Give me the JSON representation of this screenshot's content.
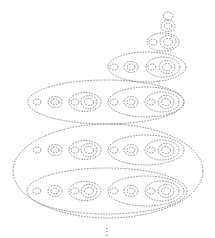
{
  "diagram": {
    "stroke_color": "#6e6e6e",
    "background": "#ffffff",
    "continuation_marker": "⋮",
    "continuation_pos": {
      "x": 107,
      "y": 232
    },
    "levels": [
      {
        "level": 1,
        "shapes": [
          {
            "cx": 168,
            "cy": 16,
            "rx": 5,
            "ry": 4
          }
        ]
      },
      {
        "level": 2,
        "shapes": [
          {
            "cx": 168,
            "cy": 26,
            "rx": 7,
            "ry": 5.5
          },
          {
            "cx": 168,
            "cy": 26,
            "rx": 4,
            "ry": 3
          }
        ]
      },
      {
        "level": 3,
        "shapes": [
          {
            "cx": 163,
            "cy": 42,
            "rx": 16,
            "ry": 9
          },
          {
            "cx": 153,
            "cy": 42,
            "rx": 4,
            "ry": 3
          },
          {
            "cx": 168,
            "cy": 42,
            "rx": 8,
            "ry": 6.5
          },
          {
            "cx": 168,
            "cy": 42,
            "rx": 4.5,
            "ry": 3.5
          }
        ]
      },
      {
        "level": 4,
        "shapes": [
          {
            "cx": 147,
            "cy": 67,
            "rx": 39,
            "ry": 15
          },
          {
            "cx": 114,
            "cy": 67,
            "rx": 4,
            "ry": 3
          },
          {
            "cx": 131,
            "cy": 67,
            "rx": 7,
            "ry": 5.5
          },
          {
            "cx": 131,
            "cy": 67,
            "rx": 4,
            "ry": 3
          },
          {
            "cx": 163,
            "cy": 67,
            "rx": 17,
            "ry": 10
          },
          {
            "cx": 152,
            "cy": 67,
            "rx": 4,
            "ry": 3
          },
          {
            "cx": 167,
            "cy": 67,
            "rx": 8,
            "ry": 6.5
          },
          {
            "cx": 167,
            "cy": 67,
            "rx": 4.5,
            "ry": 3.5
          }
        ]
      },
      {
        "level": 5,
        "shapes": [
          {
            "cx": 106,
            "cy": 102,
            "rx": 78,
            "ry": 22
          },
          {
            "cx": 37,
            "cy": 102,
            "rx": 4,
            "ry": 3
          },
          {
            "cx": 55,
            "cy": 102,
            "rx": 7,
            "ry": 5.5
          },
          {
            "cx": 55,
            "cy": 102,
            "rx": 4,
            "ry": 3
          },
          {
            "cx": 85,
            "cy": 102,
            "rx": 16,
            "ry": 9.5
          },
          {
            "cx": 75,
            "cy": 102,
            "rx": 4,
            "ry": 3
          },
          {
            "cx": 89,
            "cy": 102,
            "rx": 8,
            "ry": 6.5
          },
          {
            "cx": 89,
            "cy": 102,
            "rx": 4.5,
            "ry": 3.5
          },
          {
            "cx": 146,
            "cy": 102,
            "rx": 38,
            "ry": 15
          },
          {
            "cx": 114,
            "cy": 102,
            "rx": 4,
            "ry": 3
          },
          {
            "cx": 131,
            "cy": 102,
            "rx": 7,
            "ry": 5.5
          },
          {
            "cx": 131,
            "cy": 102,
            "rx": 4,
            "ry": 3
          },
          {
            "cx": 162,
            "cy": 102,
            "rx": 17,
            "ry": 10
          },
          {
            "cx": 151,
            "cy": 102,
            "rx": 4,
            "ry": 3
          },
          {
            "cx": 166,
            "cy": 102,
            "rx": 8,
            "ry": 6.5
          },
          {
            "cx": 166,
            "cy": 102,
            "rx": 4.5,
            "ry": 3.5
          }
        ]
      },
      {
        "level": 6,
        "shapes": [
          {
            "cx": 108,
            "cy": 171,
            "rx": 95,
            "ry": 47
          },
          {
            "cx": 37,
            "cy": 150,
            "rx": 4,
            "ry": 3
          },
          {
            "cx": 55,
            "cy": 150,
            "rx": 7,
            "ry": 5.5
          },
          {
            "cx": 55,
            "cy": 150,
            "rx": 4,
            "ry": 3
          },
          {
            "cx": 85,
            "cy": 150,
            "rx": 16,
            "ry": 9.5
          },
          {
            "cx": 75,
            "cy": 150,
            "rx": 4,
            "ry": 3
          },
          {
            "cx": 89,
            "cy": 150,
            "rx": 8,
            "ry": 6.5
          },
          {
            "cx": 89,
            "cy": 150,
            "rx": 4.5,
            "ry": 3.5
          },
          {
            "cx": 146,
            "cy": 150,
            "rx": 38,
            "ry": 15
          },
          {
            "cx": 114,
            "cy": 150,
            "rx": 4,
            "ry": 3
          },
          {
            "cx": 131,
            "cy": 150,
            "rx": 7,
            "ry": 5.5
          },
          {
            "cx": 131,
            "cy": 150,
            "rx": 4,
            "ry": 3
          },
          {
            "cx": 162,
            "cy": 150,
            "rx": 17,
            "ry": 10
          },
          {
            "cx": 151,
            "cy": 150,
            "rx": 4,
            "ry": 3
          },
          {
            "cx": 166,
            "cy": 150,
            "rx": 8,
            "ry": 6.5
          },
          {
            "cx": 166,
            "cy": 150,
            "rx": 4.5,
            "ry": 3.5
          },
          {
            "cx": 107,
            "cy": 191,
            "rx": 80,
            "ry": 23
          },
          {
            "cx": 37,
            "cy": 191,
            "rx": 4,
            "ry": 3
          },
          {
            "cx": 55,
            "cy": 191,
            "rx": 7,
            "ry": 5.5
          },
          {
            "cx": 55,
            "cy": 191,
            "rx": 4,
            "ry": 3
          },
          {
            "cx": 85,
            "cy": 191,
            "rx": 16,
            "ry": 9.5
          },
          {
            "cx": 75,
            "cy": 191,
            "rx": 4,
            "ry": 3
          },
          {
            "cx": 89,
            "cy": 191,
            "rx": 8,
            "ry": 6.5
          },
          {
            "cx": 89,
            "cy": 191,
            "rx": 4.5,
            "ry": 3.5
          },
          {
            "cx": 146,
            "cy": 191,
            "rx": 38,
            "ry": 15
          },
          {
            "cx": 114,
            "cy": 191,
            "rx": 4,
            "ry": 3
          },
          {
            "cx": 131,
            "cy": 191,
            "rx": 7,
            "ry": 5.5
          },
          {
            "cx": 131,
            "cy": 191,
            "rx": 4,
            "ry": 3
          },
          {
            "cx": 162,
            "cy": 191,
            "rx": 17,
            "ry": 10
          },
          {
            "cx": 151,
            "cy": 191,
            "rx": 4,
            "ry": 3
          },
          {
            "cx": 166,
            "cy": 191,
            "rx": 8,
            "ry": 6.5
          },
          {
            "cx": 166,
            "cy": 191,
            "rx": 4.5,
            "ry": 3.5
          }
        ]
      }
    ]
  }
}
